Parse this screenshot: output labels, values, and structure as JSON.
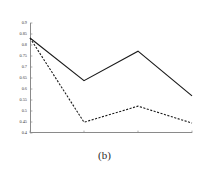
{
  "caption": "(b)",
  "chart_data": {
    "type": "line",
    "title": "",
    "xlabel": "",
    "ylabel": "",
    "x": [
      1,
      2,
      3,
      4
    ],
    "xlim": [
      1,
      4
    ],
    "ylim": [
      0.4,
      0.9
    ],
    "ytick_labels": [
      "0.9",
      "0.85",
      "0.8",
      "0.75",
      "0.7",
      "0.65",
      "0.6",
      "0.55",
      "0.5",
      "0.45",
      "0.4"
    ],
    "ytick_values": [
      0.9,
      0.85,
      0.8,
      0.75,
      0.7,
      0.65,
      0.6,
      0.55,
      0.5,
      0.45,
      0.4
    ],
    "xtick_labels": [
      "",
      "",
      "",
      ""
    ],
    "grid": false,
    "legend": "none",
    "series": [
      {
        "name": "solid",
        "style": "solid",
        "color": "#1a1a1a",
        "values": [
          0.832,
          0.638,
          0.772,
          0.569
        ]
      },
      {
        "name": "dashed",
        "style": "dashed",
        "color": "#1a1a1a",
        "values": [
          0.832,
          0.449,
          0.522,
          0.445
        ]
      }
    ]
  },
  "colors": {
    "axis": "#8a8a8a",
    "ink": "#1a1a1a",
    "background": "#ffffff"
  }
}
